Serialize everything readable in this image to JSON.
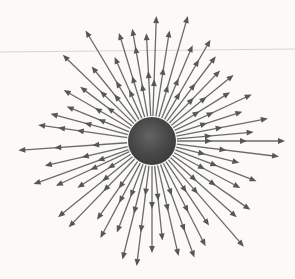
{
  "diagram": {
    "type": "radial-vector-field",
    "canvas": {
      "width": 295,
      "height": 279
    },
    "center": [
      152,
      141
    ],
    "sphere_radius": 24,
    "arrow_start_radius": 25,
    "arrowhead": {
      "length": 7,
      "half_width": 2.9
    },
    "line_width": 1.3,
    "rule_line": {
      "y_left": 52,
      "y_right": 49
    },
    "colors": {
      "background": "#fbfaf7",
      "rule": "#d8d7d2",
      "arrow_line": "#6b6b6b",
      "arrow_head": "#575757",
      "sphere_center": "#646464",
      "sphere_mid": "#474747",
      "sphere_edge": "#393939"
    },
    "rays": [
      {
        "a": -5,
        "h": [
          60,
          102
        ]
      },
      {
        "a": 0,
        "h": [
          60,
          95,
          133
        ]
      },
      {
        "a": 7,
        "h": [
          75,
          128
        ]
      },
      {
        "a": 14,
        "h": [
          55,
          90
        ]
      },
      {
        "a": 21,
        "h": [
          70,
          112
        ]
      },
      {
        "a": 28,
        "h": [
          60,
          100
        ]
      },
      {
        "a": 35,
        "h": [
          78,
          120
        ]
      },
      {
        "a": 42,
        "h": [
          60,
          114
        ]
      },
      {
        "a": 49,
        "h": [
          70,
          140
        ]
      },
      {
        "a": 56,
        "h": [
          62,
          102
        ]
      },
      {
        "a": 63,
        "h": [
          80,
          118
        ]
      },
      {
        "a": 70,
        "h": [
          58,
          96,
          124
        ]
      },
      {
        "a": 77,
        "h": [
          72,
          118
        ]
      },
      {
        "a": 84,
        "h": [
          60,
          100
        ]
      },
      {
        "a": 90,
        "h": [
          68,
          112
        ]
      },
      {
        "a": 97,
        "h": [
          55,
          92,
          126
        ]
      },
      {
        "a": 104,
        "h": [
          75,
          122
        ]
      },
      {
        "a": 111,
        "h": [
          60,
          98
        ]
      },
      {
        "a": 118,
        "h": [
          70,
          110
        ]
      },
      {
        "a": 125,
        "h": [
          58,
          96
        ]
      },
      {
        "a": 134,
        "h": [
          70,
          120
        ]
      },
      {
        "a": 141,
        "h": [
          64,
          121
        ]
      },
      {
        "a": 148,
        "h": [
          52,
          88
        ]
      },
      {
        "a": 155,
        "h": [
          68,
          106
        ]
      },
      {
        "a": 160,
        "h": [
          58,
          126
        ]
      },
      {
        "a": 167,
        "h": [
          72,
          110
        ]
      },
      {
        "a": 176,
        "h": [
          60,
          98,
          134
        ]
      },
      {
        "a": -172,
        "h": [
          76,
          95,
          115
        ]
      },
      {
        "a": -165,
        "h": [
          70,
          105
        ]
      },
      {
        "a": -158,
        "h": [
          58,
          92
        ]
      },
      {
        "a": -150,
        "h": [
          66,
          102
        ]
      },
      {
        "a": -143,
        "h": [
          56,
          90
        ]
      },
      {
        "a": -136,
        "h": [
          72,
          124
        ]
      },
      {
        "a": -129,
        "h": [
          60,
          96
        ]
      },
      {
        "a": -121,
        "h": [
          70,
          129
        ]
      },
      {
        "a": -114,
        "h": [
          56,
          92
        ]
      },
      {
        "a": -107,
        "h": [
          68,
          113
        ]
      },
      {
        "a": -100,
        "h": [
          58,
          96,
          114
        ]
      },
      {
        "a": -93,
        "h": [
          70,
          108
        ]
      },
      {
        "a": -88,
        "h": [
          62,
          125
        ]
      },
      {
        "a": -81,
        "h": [
          74,
          112
        ]
      },
      {
        "a": -74,
        "h": [
          58,
          130
        ]
      },
      {
        "a": -67,
        "h": [
          68,
          104
        ]
      },
      {
        "a": -60,
        "h": [
          56,
          94,
          117
        ]
      },
      {
        "a": -53,
        "h": [
          72,
          106
        ]
      },
      {
        "a": -46,
        "h": [
          60,
          98
        ]
      },
      {
        "a": -39,
        "h": [
          70,
          105
        ]
      },
      {
        "a": -32,
        "h": [
          56,
          92
        ]
      },
      {
        "a": -25,
        "h": [
          68,
          110
        ]
      },
      {
        "a": -18,
        "h": [
          58,
          95
        ]
      },
      {
        "a": -11,
        "h": [
          72,
          118
        ]
      }
    ]
  }
}
